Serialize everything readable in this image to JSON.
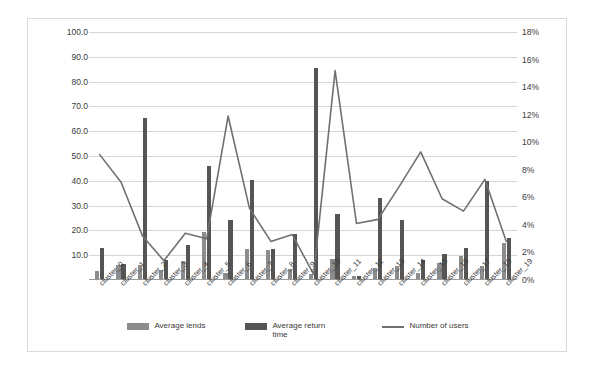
{
  "chart_data": {
    "type": "bar",
    "title": "",
    "xlabel": "",
    "ylabel": "",
    "categories": [
      "cluster_0",
      "cluster_1",
      "cluster_2",
      "cluster_3",
      "cluster_4",
      "cluster_5",
      "cluster_6",
      "cluster_7",
      "cluster_8",
      "cluster_9",
      "cluster_10",
      "cluster_11",
      "cluster_12",
      "cluster_13",
      "cluster_14",
      "cluster_15",
      "cluster_16",
      "cluster_17",
      "cluster_18",
      "cluster_19"
    ],
    "series": [
      {
        "name": "Average lends",
        "axis": "left",
        "color": "#8c8c8c",
        "values": [
          3.5,
          6.0,
          6.0,
          4.0,
          7.5,
          19.5,
          3.0,
          12.5,
          12.0,
          4.5,
          2.5,
          8.5,
          1.5,
          5.0,
          5.5,
          3.0,
          7.0,
          9.5,
          5.5,
          15.0
        ]
      },
      {
        "name": "Average return time",
        "axis": "left",
        "color": "#555555",
        "values": [
          13.0,
          6.5,
          65.5,
          8.0,
          14.0,
          46.0,
          24.0,
          40.5,
          12.5,
          18.5,
          85.5,
          26.5,
          1.5,
          33.0,
          24.0,
          8.0,
          10.5,
          13.0,
          40.0,
          17.0
        ]
      },
      {
        "name": "Number of users",
        "axis": "right",
        "color": "#707070",
        "type": "line",
        "values": [
          9.1,
          7.1,
          3.2,
          1.4,
          3.4,
          3.0,
          11.9,
          5.2,
          2.8,
          3.3,
          0.4,
          15.2,
          4.1,
          4.4,
          6.8,
          9.3,
          5.9,
          5.0,
          7.3,
          2.8
        ]
      }
    ],
    "axis_left": {
      "min": 0,
      "max": 100,
      "step": 10,
      "ticks": [
        "10.0",
        "20.0",
        "30.0",
        "40.0",
        "50.0",
        "60.0",
        "70.0",
        "80.0",
        "90.0",
        "100.0"
      ]
    },
    "axis_right": {
      "min": 0,
      "max": 18,
      "step": 2,
      "ticks": [
        "0%",
        "2%",
        "4%",
        "6%",
        "8%",
        "10%",
        "12%",
        "14%",
        "16%",
        "18%"
      ]
    },
    "grid": true,
    "legend_position": "bottom"
  },
  "legend": {
    "items": [
      {
        "label": "Average lends",
        "swatch": "bar-swatch-lends"
      },
      {
        "label": "Average return time",
        "swatch": "bar-swatch-return"
      },
      {
        "label": "Number of users",
        "swatch": "line-swatch-users"
      }
    ]
  }
}
